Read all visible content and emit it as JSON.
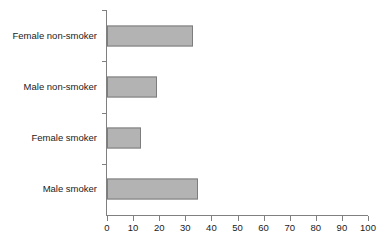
{
  "chart_data": {
    "type": "bar",
    "orientation": "horizontal",
    "title": "",
    "xlabel": "",
    "ylabel": "",
    "categories": [
      "Female non-smoker",
      "Male non-smoker",
      "Female smoker",
      "Male smoker"
    ],
    "values": [
      33,
      19,
      13,
      35
    ],
    "xlim": [
      0,
      100
    ],
    "xticks": [
      0,
      10,
      20,
      30,
      40,
      50,
      60,
      70,
      80,
      90,
      100
    ],
    "xtick_labels": [
      "0",
      "10",
      "20",
      "30",
      "40",
      "50",
      "60",
      "70",
      "80",
      "90",
      "100"
    ],
    "grid": false,
    "legend": false,
    "bar_color": "#b3b3b3",
    "bar_border_color": "#7d7d7d",
    "axis_color": "#808080",
    "text_color": "#1a1a1a",
    "background": "#ffffff"
  }
}
